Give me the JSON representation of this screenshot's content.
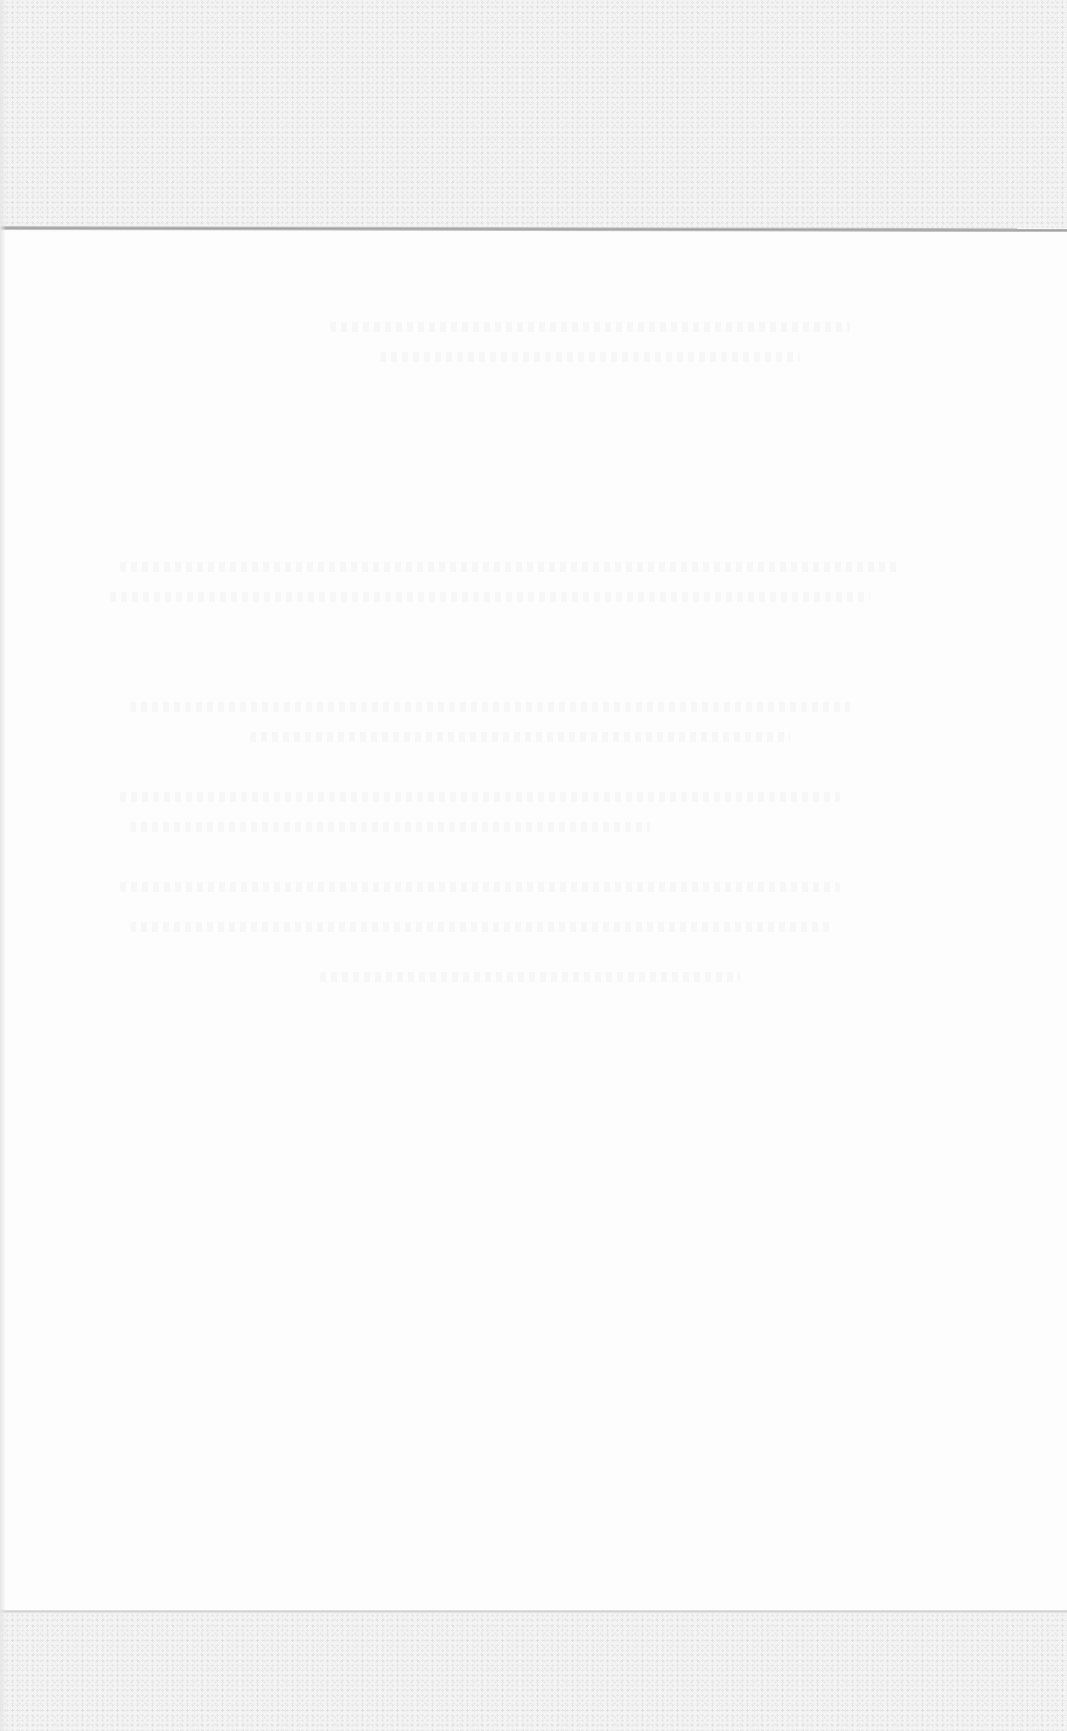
{
  "page": {
    "type": "scanned blank page",
    "background_color": "#fcfcfc",
    "band_color": "#f3f3f3",
    "rule_color": "#9d9d9d"
  },
  "regions": {
    "top_band": {
      "label": ""
    },
    "body": {
      "text": ""
    },
    "bottom_band": {
      "label": ""
    }
  }
}
